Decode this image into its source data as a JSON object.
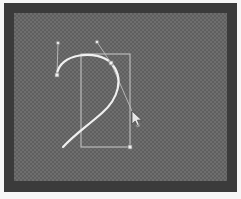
{
  "window": {
    "title": "Vector Path Editor",
    "mat_color": "#f7f7f7",
    "frame_color": "#3b3b3b"
  },
  "artboard": {
    "label": "Artboard",
    "checker_light": "#6e6e6e",
    "checker_dark": "#5f5f5f",
    "width": 213,
    "height": 168
  },
  "selection": {
    "label": "Selection bounding box",
    "stroke_color": "#c9c9c9",
    "x": 67,
    "y": 41,
    "width": 49,
    "height": 93
  },
  "path": {
    "label": "Teardrop bezier path",
    "stroke_color": "#f0f0f0",
    "stroke_width": 2.2,
    "d": "M 43 62 C 44 40 84 36 97 50 C 111 65 104 86 88 100 C 72 114 60 122 49 134",
    "fill": "none"
  },
  "handles": {
    "label": "Bezier control handles",
    "line_color": "#bdbdbd",
    "knob_fill": "#e8e8e8",
    "knob_stroke": "#8a8a8a",
    "items": [
      {
        "name": "handle-top-left",
        "anchor_x": 43,
        "anchor_y": 62,
        "ctrl_x": 44,
        "ctrl_y": 30
      },
      {
        "name": "handle-top-right",
        "anchor_x": 97,
        "anchor_y": 50,
        "ctrl_x": 83,
        "ctrl_y": 29
      },
      {
        "name": "handle-mid-right",
        "anchor_x": 97,
        "anchor_y": 50,
        "ctrl_x": 124,
        "ctrl_y": 112
      }
    ]
  },
  "nodes": {
    "label": "Path anchor nodes",
    "fill": "#f2f2f2",
    "stroke": "#7d7d7d",
    "items": [
      {
        "name": "node-start",
        "x": 43,
        "y": 62
      },
      {
        "name": "node-corner",
        "x": 97,
        "y": 50
      },
      {
        "name": "node-end",
        "x": 116,
        "y": 134
      }
    ]
  },
  "cursor": {
    "label": "Pointer cursor",
    "name": "arrow-cursor-icon",
    "x": 118,
    "y": 98,
    "fill": "#e6e6e6",
    "stroke": "#4a4a4a"
  }
}
